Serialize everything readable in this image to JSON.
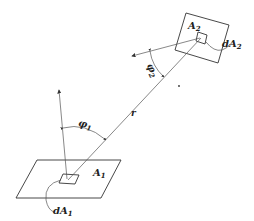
{
  "diagram": {
    "type": "radiation view factor geometry",
    "labels": {
      "A1": "A",
      "A1_sub": "1",
      "A2": "A",
      "A2_sub": "2",
      "dA1": "dA",
      "dA1_sub": "1",
      "dA2": "dA",
      "dA2_sub": "2",
      "phi1": "φ",
      "phi1_sub": "1",
      "phi2": "φ",
      "phi2_sub": "2",
      "r": "r"
    },
    "colors": {
      "stroke": "#333333",
      "background": "#ffffff"
    }
  }
}
